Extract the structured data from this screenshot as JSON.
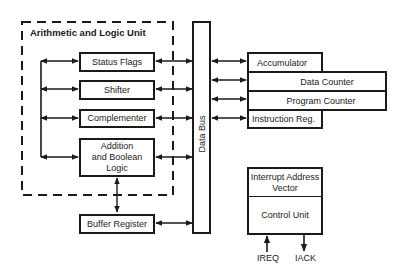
{
  "alu": {
    "title": "Arithmetic and Logic Unit",
    "blocks": [
      {
        "label": "Status Flags"
      },
      {
        "label": "Shifter"
      },
      {
        "label": "Complementer"
      },
      {
        "label_lines": [
          "Addition",
          "and Boolean",
          "Logic"
        ]
      }
    ]
  },
  "buffer_register": {
    "label": "Buffer Register"
  },
  "data_bus": {
    "label": "Data Bus"
  },
  "registers": {
    "accumulator": "Accumulator",
    "data_counter": "Data Counter",
    "program_counter": "Program Counter",
    "instruction_reg": "Instruction Reg."
  },
  "control": {
    "vector_lines": [
      "Interrupt Address",
      "Vector"
    ],
    "control_unit": "Control Unit",
    "signals": {
      "ireq": "IREQ",
      "iack": "IACK"
    }
  },
  "colors": {
    "line": "#1a1a1a",
    "background": "#ffffff"
  }
}
